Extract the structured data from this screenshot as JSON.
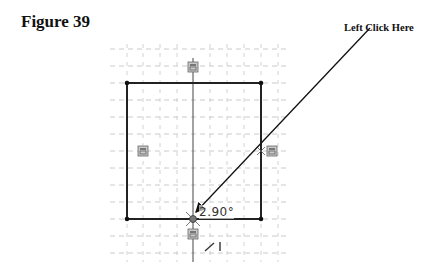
{
  "figure": {
    "title": "Figure 39",
    "callout_text": "Left Click Here"
  },
  "sketch": {
    "grid": {
      "x_start": 110,
      "x_end": 290,
      "y_start": 48,
      "y_end": 262,
      "spacing": 16.8,
      "color": "#b8b8b8"
    },
    "rectangle": {
      "x1": 127,
      "y1": 83,
      "x2": 261,
      "y2": 219,
      "stroke": "#222222"
    },
    "centerline": {
      "x": 193,
      "y1": 58,
      "y2": 262
    },
    "constraint_icons": [
      {
        "name": "constraint-icon-top",
        "x": 193,
        "y": 67
      },
      {
        "name": "constraint-icon-left",
        "x": 143,
        "y": 151
      },
      {
        "name": "constraint-icon-right",
        "x": 272,
        "y": 151
      },
      {
        "name": "constraint-icon-bottom",
        "x": 193,
        "y": 234
      }
    ],
    "angle_readout": "2.90°",
    "arrow": {
      "from_x": 370,
      "from_y": 28,
      "to_x": 194,
      "to_y": 214
    }
  }
}
